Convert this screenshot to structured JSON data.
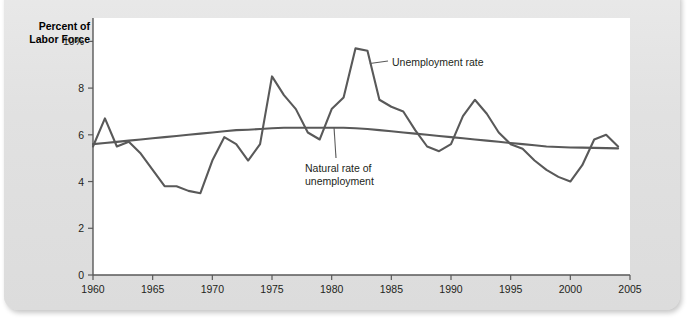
{
  "figure": {
    "caption_clipped": "",
    "axis_title": "Percent of\nLabor Force"
  },
  "annotations": {
    "unemployment_rate": "Unemployment rate",
    "natural_rate": "Natural rate of\nunemployment"
  },
  "colors": {
    "page_background": "#e3e3e3",
    "panel_background": "#ffffff",
    "line": "#595959",
    "axis": "#595959",
    "text": "#231f20"
  },
  "chart_data": {
    "type": "line",
    "title": "",
    "xlabel": "",
    "ylabel": "Percent of Labor Force",
    "xlim": [
      1960,
      2005
    ],
    "ylim": [
      0,
      11
    ],
    "grid": false,
    "legend": "annotations",
    "xticks": [
      1960,
      1965,
      1970,
      1975,
      1980,
      1985,
      1990,
      1995,
      2000,
      2005
    ],
    "xtick_labels": [
      "1960",
      "1965",
      "1970",
      "1975",
      "1980",
      "1985",
      "1990",
      "1995",
      "2000",
      "2005"
    ],
    "yticks": [
      0,
      2,
      4,
      6,
      8,
      10
    ],
    "ytick_labels": [
      "0",
      "2",
      "4",
      "6",
      "8",
      "10%"
    ],
    "x": [
      1960,
      1961,
      1962,
      1963,
      1964,
      1965,
      1966,
      1967,
      1968,
      1969,
      1970,
      1971,
      1972,
      1973,
      1974,
      1975,
      1976,
      1977,
      1978,
      1979,
      1980,
      1981,
      1982,
      1983,
      1984,
      1985,
      1986,
      1987,
      1988,
      1989,
      1990,
      1991,
      1992,
      1993,
      1994,
      1995,
      1996,
      1997,
      1998,
      1999,
      2000,
      2001,
      2002,
      2003,
      2004
    ],
    "series": [
      {
        "name": "Unemployment rate",
        "values": [
          5.5,
          6.7,
          5.5,
          5.7,
          5.2,
          4.5,
          3.8,
          3.8,
          3.6,
          3.5,
          4.9,
          5.9,
          5.6,
          4.9,
          5.6,
          8.5,
          7.7,
          7.1,
          6.1,
          5.8,
          7.1,
          7.6,
          9.7,
          9.6,
          7.5,
          7.2,
          7.0,
          6.2,
          5.5,
          5.3,
          5.6,
          6.8,
          7.5,
          6.9,
          6.1,
          5.6,
          5.4,
          4.9,
          4.5,
          4.2,
          4.0,
          4.7,
          5.8,
          6.0,
          5.5
        ]
      },
      {
        "name": "Natural rate of unemployment",
        "values": [
          5.6,
          5.65,
          5.7,
          5.75,
          5.8,
          5.85,
          5.9,
          5.95,
          6.0,
          6.05,
          6.1,
          6.15,
          6.2,
          6.22,
          6.25,
          6.28,
          6.3,
          6.3,
          6.3,
          6.3,
          6.3,
          6.3,
          6.28,
          6.25,
          6.2,
          6.15,
          6.1,
          6.05,
          6.0,
          5.95,
          5.9,
          5.85,
          5.8,
          5.75,
          5.7,
          5.65,
          5.6,
          5.55,
          5.5,
          5.48,
          5.46,
          5.45,
          5.44,
          5.43,
          5.42
        ]
      }
    ]
  }
}
